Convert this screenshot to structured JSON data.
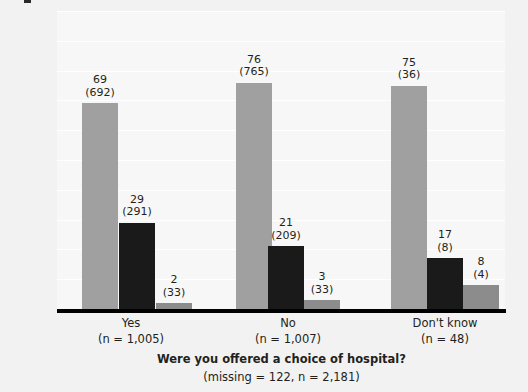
{
  "chart_data": {
    "type": "bar",
    "title": "",
    "xlabel": "Were you offered a choice of hospital?",
    "xsublabel": "(missing = 122, n = 2,181)",
    "ylabel": "Percentage (number) of respondents",
    "ylim": [
      0,
      100
    ],
    "ytick_values": [
      0,
      10,
      20,
      30,
      40,
      50,
      60,
      70,
      80,
      90,
      100
    ],
    "ytick_labels": [
      "0",
      "10",
      "20",
      "30",
      "40",
      "50",
      "60",
      "70",
      "80",
      "90",
      "100"
    ],
    "grid": true,
    "legend": "none",
    "categories": [
      "Yes",
      "No",
      "Don't know"
    ],
    "category_sublabels": [
      "(n = 1,005)",
      "(n = 1,007)",
      "(n = 48)"
    ],
    "series": [
      {
        "name": "series-1",
        "color": "#a0a0a0",
        "values": [
          69,
          76,
          75
        ],
        "counts": [
          692,
          765,
          36
        ]
      },
      {
        "name": "series-2",
        "color": "#1a1a1a",
        "values": [
          29,
          21,
          17
        ],
        "counts": [
          291,
          209,
          8
        ]
      },
      {
        "name": "series-3",
        "color": "#8c8c8c",
        "values": [
          2,
          3,
          8
        ],
        "counts": [
          33,
          33,
          4
        ]
      }
    ],
    "bar_labels": [
      [
        "69",
        "76",
        "75"
      ],
      [
        "29",
        "21",
        "17"
      ],
      [
        "2",
        "3",
        "8"
      ]
    ],
    "bar_count_labels": [
      [
        "(692)",
        "(765)",
        "(36)"
      ],
      [
        "(291)",
        "(209)",
        "(8)"
      ],
      [
        "(33)",
        "(33)",
        "(4)"
      ]
    ],
    "colors": {
      "plot_background": "#f7f7f7",
      "page_background": "#f2f2f2",
      "gridline": "#ffffff",
      "axis": "#000000",
      "text": "#231f20"
    }
  },
  "caption_fragment": ""
}
